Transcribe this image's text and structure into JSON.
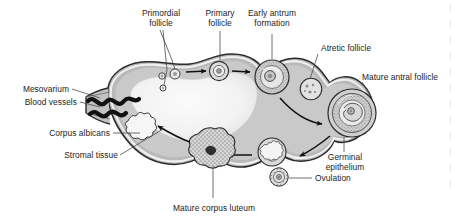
{
  "figure": {
    "background_color": "#ffffff",
    "line_color": "#1a1a1a",
    "stroma_fill": "#b8b8b8",
    "medulla_fill": "#efefef",
    "cortex_fill": "#cfcfcf"
  },
  "labels": {
    "primordial_follicle": "Primordial\nfollicle",
    "primordial_follicle_line1": "Primordial",
    "primordial_follicle_line2": "follicle",
    "primary_follicle_line1": "Primary",
    "primary_follicle_line2": "follicle",
    "early_antrum_line1": "Early antrum",
    "early_antrum_line2": "formation",
    "atretic_follicle": "Atretic follicle",
    "mature_antral_follicle": "Mature antral follicle",
    "germinal_epithelium_line1": "Germinal",
    "germinal_epithelium_line2": "epithelium",
    "ovulation": "Ovulation",
    "mature_corpus_luteum": "Mature corpus luteum",
    "stromal_tissue": "Stromal tissue",
    "corpus_albicans": "Corpus albicans",
    "blood_vessels": "Blood vessels",
    "mesovarium": "Mesovarium"
  },
  "structures": [
    {
      "name": "primordial-follicle",
      "label": "Primordial follicle",
      "stage": 1
    },
    {
      "name": "primary-follicle",
      "label": "Primary follicle",
      "stage": 2
    },
    {
      "name": "early-antrum-formation",
      "label": "Early antrum formation",
      "stage": 3
    },
    {
      "name": "atretic-follicle",
      "label": "Atretic follicle",
      "stage": 0
    },
    {
      "name": "mature-antral-follicle",
      "label": "Mature antral follicle",
      "stage": 4
    },
    {
      "name": "ovulation",
      "label": "Ovulation",
      "stage": 5
    },
    {
      "name": "mature-corpus-luteum",
      "label": "Mature corpus luteum",
      "stage": 6
    },
    {
      "name": "corpus-albicans",
      "label": "Corpus albicans",
      "stage": 7
    },
    {
      "name": "germinal-epithelium",
      "label": "Germinal epithelium",
      "stage": 0
    },
    {
      "name": "stromal-tissue",
      "label": "Stromal tissue",
      "stage": 0
    },
    {
      "name": "blood-vessels",
      "label": "Blood vessels",
      "stage": 0
    },
    {
      "name": "mesovarium",
      "label": "Mesovarium",
      "stage": 0
    }
  ]
}
